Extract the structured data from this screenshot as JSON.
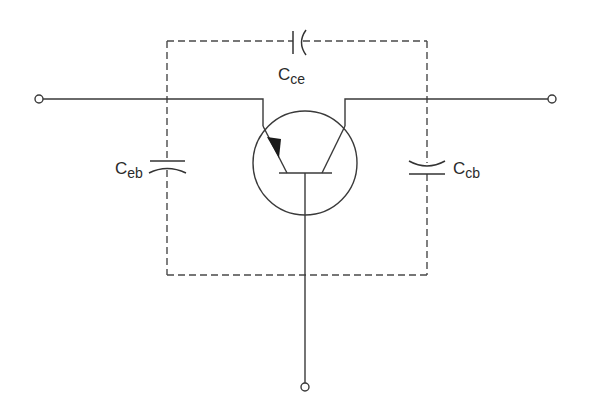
{
  "diagram": {
    "type": "circuit-schematic",
    "colors": {
      "line": "#3a3a3a",
      "background": "#ffffff"
    },
    "components": {
      "transistor": {
        "kind": "bipolar-junction-transistor",
        "terminals": [
          "emitter",
          "base",
          "collector"
        ]
      },
      "capacitors": [
        {
          "id": "cce",
          "symbol": "C",
          "subscript": "ce",
          "between": "collector-emitter",
          "position": "top"
        },
        {
          "id": "ceb",
          "symbol": "C",
          "subscript": "eb",
          "between": "emitter-base",
          "position": "left"
        },
        {
          "id": "ccb",
          "symbol": "C",
          "subscript": "cb",
          "between": "collector-base",
          "position": "right"
        }
      ],
      "terminals": [
        {
          "id": "left",
          "connects": "emitter"
        },
        {
          "id": "right",
          "connects": "collector"
        },
        {
          "id": "bottom",
          "connects": "base"
        }
      ],
      "boundary": {
        "style": "dashed",
        "shape": "rectangle"
      }
    },
    "labels": {
      "cce": {
        "main": "C",
        "sub": "ce"
      },
      "ceb": {
        "main": "C",
        "sub": "eb"
      },
      "ccb": {
        "main": "C",
        "sub": "cb"
      }
    }
  }
}
